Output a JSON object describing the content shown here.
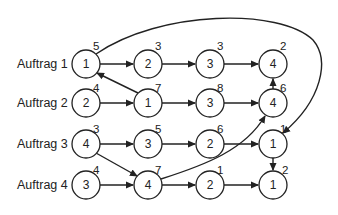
{
  "diagram": {
    "type": "job-shop disjunctive graph",
    "rows": [
      {
        "label": "Auftrag 1",
        "y": 64
      },
      {
        "label": "Auftrag 2",
        "y": 103
      },
      {
        "label": "Auftrag 3",
        "y": 144
      },
      {
        "label": "Auftrag 4",
        "y": 185
      }
    ],
    "columns_x": [
      86,
      148,
      210,
      273
    ],
    "nodes": [
      {
        "id": "a1_1",
        "row": 0,
        "col": 0,
        "machine": "1",
        "duration": "5"
      },
      {
        "id": "a1_2",
        "row": 0,
        "col": 1,
        "machine": "2",
        "duration": "3"
      },
      {
        "id": "a1_3",
        "row": 0,
        "col": 2,
        "machine": "3",
        "duration": "3"
      },
      {
        "id": "a1_4",
        "row": 0,
        "col": 3,
        "machine": "4",
        "duration": "2"
      },
      {
        "id": "a2_1",
        "row": 1,
        "col": 0,
        "machine": "2",
        "duration": "4"
      },
      {
        "id": "a2_2",
        "row": 1,
        "col": 1,
        "machine": "1",
        "duration": "7"
      },
      {
        "id": "a2_3",
        "row": 1,
        "col": 2,
        "machine": "3",
        "duration": "8"
      },
      {
        "id": "a2_4",
        "row": 1,
        "col": 3,
        "machine": "4",
        "duration": "6"
      },
      {
        "id": "a3_1",
        "row": 2,
        "col": 0,
        "machine": "4",
        "duration": "3"
      },
      {
        "id": "a3_2",
        "row": 2,
        "col": 1,
        "machine": "3",
        "duration": "5"
      },
      {
        "id": "a3_3",
        "row": 2,
        "col": 2,
        "machine": "2",
        "duration": "6"
      },
      {
        "id": "a3_4",
        "row": 2,
        "col": 3,
        "machine": "1",
        "duration": "1"
      },
      {
        "id": "a4_1",
        "row": 3,
        "col": 0,
        "machine": "3",
        "duration": "4"
      },
      {
        "id": "a4_2",
        "row": 3,
        "col": 1,
        "machine": "4",
        "duration": "7"
      },
      {
        "id": "a4_3",
        "row": 3,
        "col": 2,
        "machine": "2",
        "duration": "1"
      },
      {
        "id": "a4_4",
        "row": 3,
        "col": 3,
        "machine": "1",
        "duration": "2"
      }
    ],
    "edges": [
      {
        "from": "a1_1",
        "to": "a1_2",
        "kind": "conjunctive"
      },
      {
        "from": "a1_2",
        "to": "a1_3",
        "kind": "conjunctive"
      },
      {
        "from": "a1_3",
        "to": "a1_4",
        "kind": "conjunctive"
      },
      {
        "from": "a2_1",
        "to": "a2_2",
        "kind": "conjunctive"
      },
      {
        "from": "a2_2",
        "to": "a2_3",
        "kind": "conjunctive"
      },
      {
        "from": "a2_3",
        "to": "a2_4",
        "kind": "conjunctive"
      },
      {
        "from": "a3_1",
        "to": "a3_2",
        "kind": "conjunctive"
      },
      {
        "from": "a3_2",
        "to": "a3_3",
        "kind": "conjunctive"
      },
      {
        "from": "a3_3",
        "to": "a3_4",
        "kind": "conjunctive"
      },
      {
        "from": "a4_1",
        "to": "a4_2",
        "kind": "conjunctive"
      },
      {
        "from": "a4_2",
        "to": "a4_3",
        "kind": "conjunctive"
      },
      {
        "from": "a4_3",
        "to": "a4_4",
        "kind": "conjunctive"
      },
      {
        "from": "a2_2",
        "to": "a1_1",
        "kind": "machine 1"
      },
      {
        "from": "a2_4",
        "to": "a1_4",
        "kind": "machine 4"
      },
      {
        "from": "a3_1",
        "to": "a4_2",
        "kind": "machine 4"
      },
      {
        "from": "a4_2",
        "to": "a2_4",
        "kind": "machine 4"
      },
      {
        "from": "a1_1",
        "to": "a3_4",
        "kind": "machine 1"
      },
      {
        "from": "a3_4",
        "to": "a4_4",
        "kind": "machine 1"
      }
    ]
  }
}
